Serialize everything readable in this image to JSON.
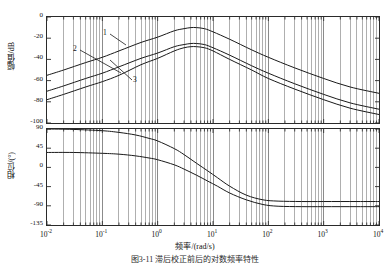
{
  "figure": {
    "top_strip_text": "",
    "caption": "图3-11 滞后校正前后的对数频率特性",
    "xaxis_title": "频率/(rad/s)",
    "curve_labels": [
      "1",
      "2",
      "3"
    ]
  },
  "chart_data": [
    {
      "type": "line",
      "title": "幅值",
      "xlabel": "频率/(rad/s)",
      "ylabel": "幅值/dB",
      "xscale": "log",
      "xlim": [
        0.01,
        10000
      ],
      "ylim": [
        -100,
        0
      ],
      "yticks": [
        0,
        -20,
        -40,
        -60,
        -80,
        -100
      ],
      "ytick_labels": [
        "0",
        "-20",
        "-40",
        "-60",
        "-80",
        "-100"
      ],
      "xticks": [
        0.01,
        0.1,
        1,
        10,
        100,
        1000,
        10000
      ],
      "xtick_labels": [
        "10-2",
        "10-1",
        "100",
        "101",
        "102",
        "103",
        "104"
      ],
      "grid": "minor-log-vertical",
      "x": [
        0.01,
        0.02,
        0.05,
        0.1,
        0.2,
        0.5,
        1,
        2,
        3,
        4,
        5,
        7,
        10,
        20,
        50,
        100,
        300,
        1000,
        3000,
        10000
      ],
      "series": [
        {
          "name": "1",
          "values": [
            -55,
            -50,
            -43,
            -38,
            -32,
            -24,
            -19,
            -13,
            -11,
            -10,
            -10,
            -11,
            -14,
            -21,
            -31,
            -38,
            -48,
            -58,
            -66,
            -72
          ]
        },
        {
          "name": "2",
          "values": [
            -70,
            -65,
            -58,
            -53,
            -47,
            -39,
            -34,
            -28,
            -26,
            -25,
            -25,
            -26,
            -29,
            -36,
            -46,
            -53,
            -63,
            -73,
            -81,
            -87
          ]
        },
        {
          "name": "3",
          "values": [
            -78,
            -73,
            -66,
            -61,
            -55,
            -45,
            -39,
            -32,
            -29,
            -28,
            -28,
            -29,
            -32,
            -40,
            -50,
            -58,
            -68,
            -78,
            -86,
            -92
          ]
        }
      ]
    },
    {
      "type": "line",
      "title": "相位",
      "xlabel": "频率/(rad/s)",
      "ylabel": "相位/(°)",
      "xscale": "log",
      "xlim": [
        0.01,
        10000
      ],
      "ylim": [
        -135,
        90
      ],
      "yticks": [
        90,
        45,
        0,
        -45,
        -90,
        -135
      ],
      "ytick_labels": [
        "90",
        "45",
        "0",
        "-45",
        "-90",
        "-135"
      ],
      "xticks": [
        0.01,
        0.1,
        1,
        10,
        100,
        1000,
        10000
      ],
      "xtick_labels": [
        "10-2",
        "10-1",
        "100",
        "101",
        "102",
        "103",
        "104"
      ],
      "grid": "minor-log-vertical",
      "x": [
        0.01,
        0.03,
        0.1,
        0.2,
        0.4,
        0.7,
        1,
        2,
        3,
        5,
        8,
        12,
        20,
        40,
        80,
        150,
        400,
        1000,
        4000,
        10000
      ],
      "series": [
        {
          "name": "phase-a",
          "values": [
            90,
            89,
            86,
            82,
            76,
            68,
            62,
            44,
            30,
            10,
            -8,
            -24,
            -44,
            -65,
            -76,
            -79,
            -80,
            -80,
            -80,
            -80
          ]
        },
        {
          "name": "phase-b",
          "values": [
            35,
            35,
            33,
            31,
            27,
            22,
            18,
            6,
            -4,
            -18,
            -32,
            -44,
            -60,
            -76,
            -87,
            -91,
            -92,
            -92,
            -92,
            -92
          ]
        }
      ]
    }
  ],
  "colors": {
    "axis": "#2a2a2a",
    "curve": "#1a1a1a",
    "gridline": "#6e6e6e",
    "background": "#ffffff"
  }
}
